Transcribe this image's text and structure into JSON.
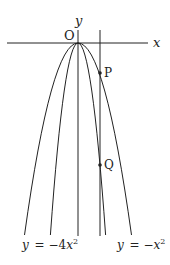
{
  "diagram": {
    "axes": {
      "x_label": "x",
      "y_label": "y",
      "origin_label": "O"
    },
    "curves": [
      {
        "id": "outer",
        "equation_lhs": "y = −",
        "equation_var": "x",
        "equation_exp": "2",
        "a": -1
      },
      {
        "id": "inner",
        "equation_lhs": "y = −4",
        "equation_var": "x",
        "equation_exp": "2",
        "a": -4
      }
    ],
    "points": [
      {
        "label": "P",
        "on_curve": "y = −x²"
      },
      {
        "label": "Q",
        "on_curve": "y = −4x²"
      }
    ],
    "vertical_line": {
      "description": "vertical line x = k through P and Q"
    },
    "colors": {
      "stroke": "#222222",
      "background": "#ffffff"
    }
  }
}
